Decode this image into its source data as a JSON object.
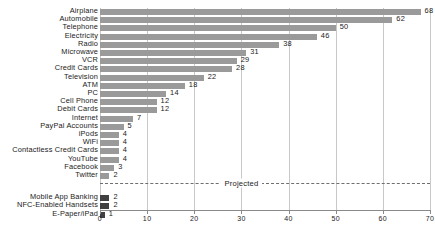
{
  "chart_data": {
    "type": "bar",
    "orientation": "horizontal",
    "title": "",
    "subtitle": "",
    "xlabel": "",
    "ylabel": "",
    "xlim": [
      0,
      70
    ],
    "xticks": [
      0,
      10,
      20,
      30,
      40,
      50,
      60,
      70
    ],
    "xticklabels": [
      "0",
      "10",
      "20",
      "30",
      "40",
      "50",
      "60",
      "70"
    ],
    "grid": true,
    "grid_axis": "x",
    "legend": null,
    "categories": [
      "Airplane",
      "Automobile",
      "Telephone",
      "Electricity",
      "Radio",
      "Microwave",
      "VCR",
      "Credit Cards",
      "Television",
      "ATM",
      "PC",
      "Cell Phone",
      "Debit Cards",
      "Internet",
      "PayPal Accounts",
      "iPods",
      "WiFi",
      "Contactless Credit Cards",
      "YouTube",
      "Facebook",
      "Twitter",
      "Mobile App Banking",
      "NFC-Enabled Handsets",
      "E-Paper/iPad"
    ],
    "values": [
      68,
      62,
      50,
      46,
      38,
      31,
      29,
      28,
      22,
      18,
      14,
      12,
      12,
      7,
      5,
      4,
      4,
      4,
      4,
      3,
      2,
      2,
      2,
      1
    ],
    "bars": [
      {
        "label": "Airplane",
        "value": 68,
        "value_text": "68",
        "projected": false
      },
      {
        "label": "Automobile",
        "value": 62,
        "value_text": "62",
        "projected": false
      },
      {
        "label": "Telephone",
        "value": 50,
        "value_text": "50",
        "projected": false
      },
      {
        "label": "Electricity",
        "value": 46,
        "value_text": "46",
        "projected": false
      },
      {
        "label": "Radio",
        "value": 38,
        "value_text": "38",
        "projected": false
      },
      {
        "label": "Microwave",
        "value": 31,
        "value_text": "31",
        "projected": false
      },
      {
        "label": "VCR",
        "value": 29,
        "value_text": "29",
        "projected": false
      },
      {
        "label": "Credit Cards",
        "value": 28,
        "value_text": "28",
        "projected": false
      },
      {
        "label": "Television",
        "value": 22,
        "value_text": "22",
        "projected": false
      },
      {
        "label": "ATM",
        "value": 18,
        "value_text": "18",
        "projected": false
      },
      {
        "label": "PC",
        "value": 14,
        "value_text": "14",
        "projected": false
      },
      {
        "label": "Cell Phone",
        "value": 12,
        "value_text": "12",
        "projected": false
      },
      {
        "label": "Debit Cards",
        "value": 12,
        "value_text": "12",
        "projected": false
      },
      {
        "label": "Internet",
        "value": 7,
        "value_text": "7",
        "projected": false
      },
      {
        "label": "PayPal Accounts",
        "value": 5,
        "value_text": "5",
        "projected": false
      },
      {
        "label": "iPods",
        "value": 4,
        "value_text": "4",
        "projected": false
      },
      {
        "label": "WiFi",
        "value": 4,
        "value_text": "4",
        "projected": false
      },
      {
        "label": "Contactless Credit Cards",
        "value": 4,
        "value_text": "4",
        "projected": false
      },
      {
        "label": "YouTube",
        "value": 4,
        "value_text": "4",
        "projected": false
      },
      {
        "label": "Facebook",
        "value": 3,
        "value_text": "3",
        "projected": false
      },
      {
        "label": "Twitter",
        "value": 2,
        "value_text": "2",
        "projected": false
      },
      {
        "label": "Mobile App Banking",
        "value": 2,
        "value_text": "2",
        "projected": true
      },
      {
        "label": "NFC-Enabled Handsets",
        "value": 2,
        "value_text": "2",
        "projected": true
      },
      {
        "label": "E-Paper/iPad",
        "value": 1,
        "value_text": "1",
        "projected": true
      }
    ],
    "annotations": [
      {
        "text": "Projected",
        "type": "divider-label",
        "x": 30,
        "after_category": "Twitter"
      }
    ],
    "colors": {
      "bar": "#9a9a9a",
      "bar_projected": "#404040",
      "gridline": "#c8c8c8",
      "axis": "#8a8a8a",
      "divider": "#6f6f6f",
      "text": "#1a1a1a",
      "background": "#ffffff"
    }
  }
}
